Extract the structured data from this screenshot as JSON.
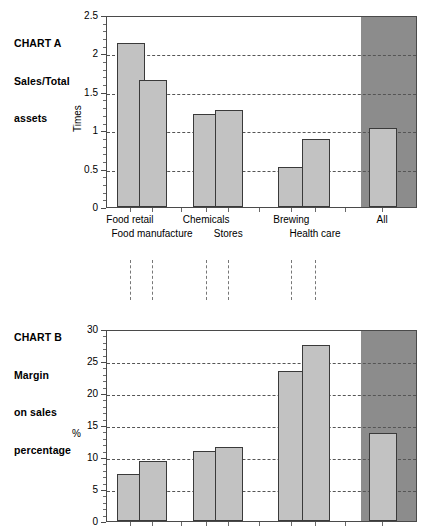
{
  "chart_data": [
    {
      "id": "chart-a",
      "type": "bar",
      "title": "CHART A",
      "title_lines": [
        "CHART A",
        "Sales/Total",
        "assets"
      ],
      "subtitle": "Sales/Total assets",
      "ylabel": "Times",
      "xlabel": "",
      "ylim": [
        0,
        2.5
      ],
      "ytick_values": [
        0,
        0.5,
        1,
        1.5,
        2,
        2.5
      ],
      "ytick_labels": [
        "0",
        "0.5",
        "1",
        "1.5",
        "2",
        "2.5"
      ],
      "yminor_step": 0.1,
      "grid": "horizontal-dashed",
      "legend": "none",
      "categories": [
        "Food retail",
        "Food manufacture",
        "Chemicals",
        "Stores",
        "Brewing",
        "Health care",
        "All"
      ],
      "values": [
        2.13,
        1.65,
        1.21,
        1.26,
        0.52,
        0.89,
        1.03
      ],
      "highlight_category": "All",
      "highlight_panel_color": "#8c8c8c",
      "bar_fill": "#c2c2c2",
      "bar_edge": "#3a3a3a"
    },
    {
      "id": "chart-b",
      "type": "bar",
      "title": "CHART B",
      "title_lines": [
        "CHART B",
        "Margin",
        "on sales",
        "percentage"
      ],
      "subtitle": "Margin on sales percentage",
      "ylabel": "%",
      "xlabel": "",
      "ylim": [
        0,
        30
      ],
      "ytick_values": [
        0,
        5,
        10,
        15,
        20,
        25,
        30
      ],
      "ytick_labels": [
        "0",
        "5",
        "10",
        "15",
        "20",
        "25",
        "30"
      ],
      "yminor_step": 1,
      "grid": "horizontal-dashed",
      "legend": "none",
      "categories": [
        "Food retail",
        "Food manufacture",
        "Chemicals",
        "Stores",
        "Brewing",
        "Health care",
        "All"
      ],
      "values": [
        7.3,
        9.3,
        11.0,
        11.6,
        23.4,
        27.5,
        13.8
      ],
      "highlight_category": "All",
      "highlight_panel_color": "#8c8c8c",
      "bar_fill": "#c2c2c2",
      "bar_edge": "#3a3a3a"
    }
  ],
  "chart_a": {
    "title_line1": "CHART A",
    "title_line2": "Sales/Total",
    "title_line3": "assets",
    "ylabel": "Times",
    "yticks": [
      "2.5",
      "2",
      "1.5",
      "1",
      "0.5",
      "0"
    ],
    "xlabels_row1": [
      "Food retail",
      "Chemicals",
      "Brewing",
      "All"
    ],
    "xlabels_row2": [
      "Food manufacture",
      "Stores",
      "Health care"
    ]
  },
  "chart_b": {
    "title_line1": "CHART B",
    "title_line2": "Margin",
    "title_line3": "on sales",
    "title_line4": "percentage",
    "ylabel": "%",
    "yticks": [
      "30",
      "25",
      "20",
      "15",
      "10",
      "5",
      "0"
    ]
  }
}
